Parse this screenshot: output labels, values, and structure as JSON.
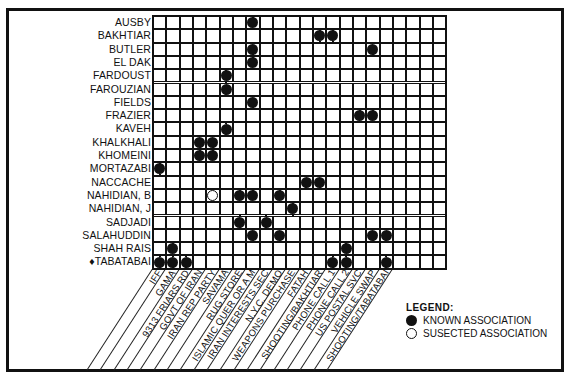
{
  "chart_data": {
    "type": "table",
    "rows": [
      "AUSBY",
      "BAKHTIAR",
      "BUTLER",
      "EL DAK",
      "FARDOUST",
      "FAROUZIAN",
      "FIELDS",
      "FRAZIER",
      "KAVEH",
      "KHALKHALI",
      "KHOMEINI",
      "MORTAZABI",
      "NACCACHE",
      "NAHIDIAN, B",
      "NAHIDIAN, J",
      "SADJADI",
      "SALAHUDDIN",
      "SHAH RAIS",
      "TABATABAI"
    ],
    "row_markers": {
      "TABATABAI": "♦"
    },
    "columns": [
      "IFF",
      "GAMA",
      "9313 FRIARS RD",
      "GOVT OF IRAN",
      "IRAN REP PARTY",
      "SAVAMA",
      "RUG STORE",
      "ISLAMIC QUER OR A M",
      "IRAN INTERESTS SEC",
      "N.Y.C. DEMO",
      "WEAPONS PURCHASE",
      "FATAH",
      "SHOOTING/BAKHTIAR",
      "PHONE CALL 1",
      "PHONE CALL 2",
      "US POSTAL SVC",
      "VEHICLE SWAP",
      "SHOOTING/TABATABAI",
      "",
      "",
      "",
      ""
    ],
    "grid_columns": 22,
    "associations": [
      {
        "row": 0,
        "col": 7,
        "type": "known"
      },
      {
        "row": 1,
        "col": 12,
        "type": "known"
      },
      {
        "row": 1,
        "col": 13,
        "type": "known"
      },
      {
        "row": 2,
        "col": 7,
        "type": "known"
      },
      {
        "row": 2,
        "col": 16,
        "type": "known"
      },
      {
        "row": 3,
        "col": 7,
        "type": "known"
      },
      {
        "row": 4,
        "col": 5,
        "type": "known"
      },
      {
        "row": 5,
        "col": 5,
        "type": "known"
      },
      {
        "row": 6,
        "col": 7,
        "type": "known"
      },
      {
        "row": 7,
        "col": 15,
        "type": "known"
      },
      {
        "row": 7,
        "col": 16,
        "type": "known"
      },
      {
        "row": 8,
        "col": 5,
        "type": "known"
      },
      {
        "row": 9,
        "col": 3,
        "type": "known"
      },
      {
        "row": 9,
        "col": 4,
        "type": "known"
      },
      {
        "row": 10,
        "col": 3,
        "type": "known"
      },
      {
        "row": 10,
        "col": 4,
        "type": "known"
      },
      {
        "row": 11,
        "col": 0,
        "type": "known"
      },
      {
        "row": 12,
        "col": 11,
        "type": "known"
      },
      {
        "row": 12,
        "col": 12,
        "type": "known"
      },
      {
        "row": 13,
        "col": 4,
        "type": "suspected"
      },
      {
        "row": 13,
        "col": 6,
        "type": "known"
      },
      {
        "row": 13,
        "col": 7,
        "type": "known"
      },
      {
        "row": 13,
        "col": 9,
        "type": "known"
      },
      {
        "row": 14,
        "col": 10,
        "type": "known"
      },
      {
        "row": 15,
        "col": 6,
        "type": "known"
      },
      {
        "row": 15,
        "col": 8,
        "type": "known"
      },
      {
        "row": 16,
        "col": 7,
        "type": "known"
      },
      {
        "row": 16,
        "col": 9,
        "type": "known"
      },
      {
        "row": 16,
        "col": 16,
        "type": "known"
      },
      {
        "row": 16,
        "col": 17,
        "type": "known"
      },
      {
        "row": 17,
        "col": 1,
        "type": "known"
      },
      {
        "row": 17,
        "col": 14,
        "type": "known"
      },
      {
        "row": 18,
        "col": 0,
        "type": "known"
      },
      {
        "row": 18,
        "col": 1,
        "type": "known"
      },
      {
        "row": 18,
        "col": 2,
        "type": "known"
      },
      {
        "row": 18,
        "col": 13,
        "type": "known"
      },
      {
        "row": 18,
        "col": 14,
        "type": "known"
      },
      {
        "row": 18,
        "col": 17,
        "type": "known"
      }
    ],
    "legend": [
      {
        "symbol": "filled-circle",
        "label": "KNOWN ASSOCIATION"
      },
      {
        "symbol": "open-circle",
        "label": "SUSECTED ASSOCIATION"
      }
    ]
  },
  "legend": {
    "title": "LEGEND:",
    "known_label": "KNOWN ASSOCIATION",
    "suspected_label": "SUSECTED ASSOCIATION"
  },
  "colors": {
    "ink": "#111111",
    "background": "#ffffff"
  }
}
